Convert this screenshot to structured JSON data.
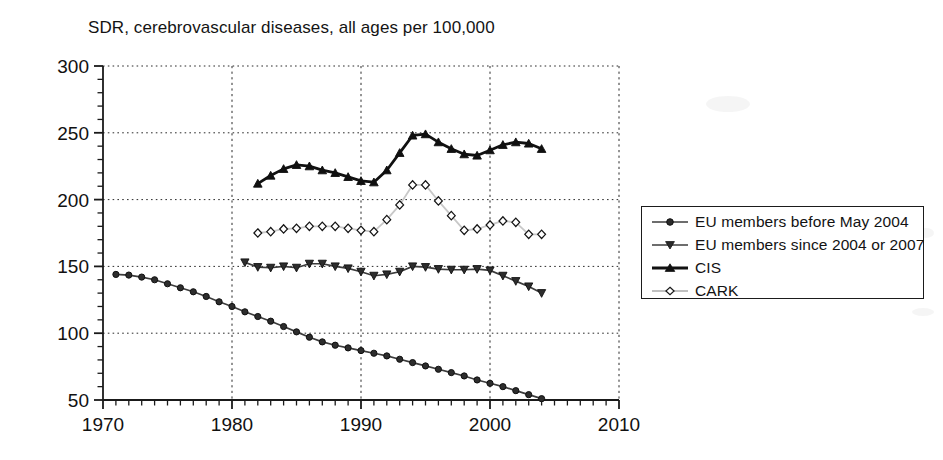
{
  "chart_data": {
    "type": "line",
    "title": "SDR, cerebrovascular diseases, all ages per 100,000",
    "xlabel": "",
    "ylabel": "",
    "xlim": [
      1970,
      2010
    ],
    "ylim": [
      50,
      300
    ],
    "xticks": [
      1970,
      1980,
      1990,
      2000,
      2010
    ],
    "yticks": [
      50,
      100,
      150,
      200,
      250,
      300
    ],
    "x_minor_tick_step": 1,
    "y_minor_tick_step": 10,
    "grid": "dotted, both axes, at major ticks",
    "legend_position": "right, outside plot area",
    "series": [
      {
        "name": "EU members before May 2004",
        "marker": "circle-filled",
        "color": "#3c3c3c",
        "line_width": 1.7,
        "x": [
          1971,
          1972,
          1973,
          1974,
          1975,
          1976,
          1977,
          1978,
          1979,
          1980,
          1981,
          1982,
          1983,
          1984,
          1985,
          1986,
          1987,
          1988,
          1989,
          1990,
          1991,
          1992,
          1993,
          1994,
          1995,
          1996,
          1997,
          1998,
          1999,
          2000,
          2001,
          2002,
          2003,
          2004
        ],
        "values": [
          144,
          143.5,
          142,
          140,
          137,
          134,
          131,
          127.5,
          123.5,
          120,
          116,
          112.5,
          109,
          105,
          101,
          97,
          93.5,
          91,
          89,
          87,
          85,
          83,
          80.5,
          78,
          75.5,
          73,
          70.5,
          68,
          65,
          62.5,
          60,
          57,
          54,
          51
        ]
      },
      {
        "name": "EU members since 2004 or 2007",
        "marker": "triangle-down-filled",
        "color": "#3c3c3c",
        "line_width": 1.7,
        "x": [
          1981,
          1982,
          1983,
          1984,
          1985,
          1986,
          1987,
          1988,
          1989,
          1990,
          1991,
          1992,
          1993,
          1994,
          1995,
          1996,
          1997,
          1998,
          1999,
          2000,
          2001,
          2002,
          2003,
          2004
        ],
        "values": [
          153,
          149.5,
          149,
          150,
          149,
          152,
          152,
          150,
          148.5,
          146,
          143,
          144,
          146,
          150,
          149.5,
          148,
          147.5,
          147.5,
          148,
          147,
          143,
          139,
          135,
          130
        ]
      },
      {
        "name": "CIS",
        "marker": "triangle-up-filled",
        "color": "#111111",
        "line_width": 2.8,
        "x": [
          1982,
          1983,
          1984,
          1985,
          1986,
          1987,
          1988,
          1989,
          1990,
          1991,
          1992,
          1993,
          1994,
          1995,
          1996,
          1997,
          1998,
          1999,
          2000,
          2001,
          2002,
          2003,
          2004
        ],
        "values": [
          212,
          218,
          223,
          226,
          225,
          222,
          220,
          217,
          214,
          213,
          222,
          235,
          248,
          249,
          243,
          238,
          234,
          233,
          237,
          241,
          243,
          242,
          238
        ]
      },
      {
        "name": "CARK",
        "marker": "diamond-open",
        "color": "#c8c8c8",
        "line_width": 1.8,
        "x": [
          1982,
          1983,
          1984,
          1985,
          1986,
          1987,
          1988,
          1989,
          1990,
          1991,
          1992,
          1993,
          1994,
          1995,
          1996,
          1997,
          1998,
          1999,
          2000,
          2001,
          2002,
          2003,
          2004
        ],
        "values": [
          175,
          176,
          178,
          178.5,
          180,
          180,
          180,
          178.5,
          177,
          176,
          185,
          196,
          211,
          211,
          199,
          188,
          177,
          178,
          181,
          184,
          183,
          174,
          174
        ]
      }
    ]
  },
  "legend": {
    "items": [
      {
        "label": "EU members before May 2004",
        "marker": "circle-filled"
      },
      {
        "label": "EU members since 2004 or 2007",
        "marker": "triangle-down-filled"
      },
      {
        "label": "CIS",
        "marker": "triangle-up-filled"
      },
      {
        "label": "CARK",
        "marker": "diamond-open"
      }
    ]
  }
}
